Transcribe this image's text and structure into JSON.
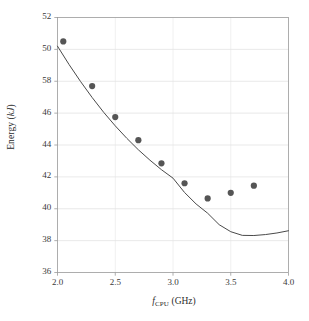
{
  "chart_data": {
    "type": "scatter",
    "title": "",
    "xlabel": "f_CPU (GHz)",
    "ylabel": "Energy (kJ)",
    "xlabel_parts": {
      "variable": "f",
      "subscript": "CPU",
      "unit": "(GHz)"
    },
    "ylabel_parts": {
      "name": "Energy",
      "unit": "(kJ)"
    },
    "xlim": [
      2.0,
      4.0
    ],
    "ylim": [
      36,
      52
    ],
    "xticks": [
      "2.0",
      "2.5",
      "3.0",
      "3.5",
      "4.0"
    ],
    "xtick_values": [
      2.0,
      2.5,
      3.0,
      3.5,
      4.0
    ],
    "yticks": [
      "52",
      "50",
      "58",
      "46",
      "44",
      "42",
      "40",
      "38",
      "36"
    ],
    "ytick_values": [
      52,
      50,
      48,
      46,
      44,
      42,
      40,
      38,
      36
    ],
    "grid": true,
    "grid_color": "#e3e3e3",
    "legend": "none",
    "marker_color": "#555555",
    "marker_size": 3.1,
    "line_color": "#4a4a4a",
    "line_width": 1.0,
    "frame_color": "#9a9a9a",
    "scatter": {
      "name": "Measured energy",
      "x": [
        2.05,
        2.3,
        2.5,
        2.7,
        2.9,
        3.1,
        3.3,
        3.5,
        3.7
      ],
      "y": [
        50.5,
        47.7,
        45.75,
        44.3,
        42.85,
        41.6,
        40.65,
        41.0,
        41.45
      ]
    },
    "series": [
      {
        "name": "Fitted model",
        "type": "line",
        "x": [
          2.0,
          2.1,
          2.2,
          2.3,
          2.4,
          2.5,
          2.6,
          2.7,
          2.8,
          2.9,
          3.0,
          3.1,
          3.2,
          3.3,
          3.4,
          3.5,
          3.6,
          3.7,
          3.8,
          3.9,
          4.0
        ],
        "y": [
          50.2,
          49.05,
          47.98,
          46.98,
          46.05,
          45.2,
          44.42,
          43.7,
          43.05,
          42.45,
          41.92,
          41.02,
          40.3,
          39.72,
          39.0,
          38.56,
          38.33,
          38.32,
          38.38,
          38.48,
          38.62
        ]
      }
    ]
  }
}
